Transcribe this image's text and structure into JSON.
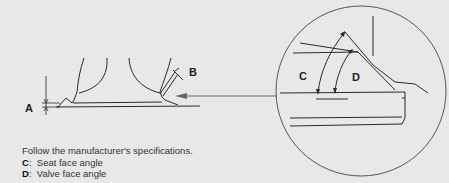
{
  "figure": {
    "labels": {
      "A": "A",
      "B": "B",
      "C": "C",
      "D": "D"
    },
    "colors": {
      "background": "#e8e8e8",
      "line": "#2a2a2a",
      "arrow": "#666666",
      "circle": "#555555"
    }
  },
  "caption": {
    "intro": "Follow the manufacturer's specifications.",
    "items": [
      {
        "key": "C",
        "sep": ":",
        "text": "Seat face angle"
      },
      {
        "key": "D",
        "sep": ":",
        "text": "Valve face angle"
      }
    ]
  }
}
